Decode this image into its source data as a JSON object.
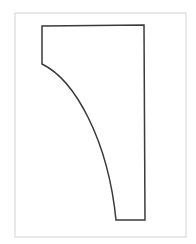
{
  "diagram": {
    "type": "technical-drawing",
    "frame": {
      "x": 15,
      "y": 13,
      "width": 171,
      "height": 224,
      "stroke": "#d4d4d4"
    },
    "shape": {
      "stroke": "#3a3a3a",
      "stroke_width": 1.5,
      "path": "M42,26 L144,25 L145,220 L116,220 C108,140 75,80 42,64 Z"
    },
    "colors": {
      "background": "#ffffff",
      "frame": "#d4d4d4",
      "outline": "#3a3a3a"
    }
  }
}
